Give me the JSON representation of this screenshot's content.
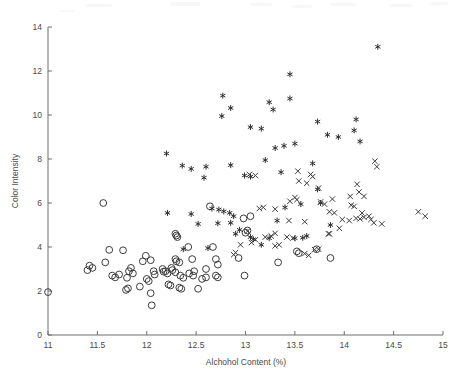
{
  "figure": {
    "background_color": "#ffffff",
    "marker_color": "#3d3d3d",
    "axis_color": "#6e6e6e"
  },
  "chart_data": {
    "type": "scatter",
    "title": "",
    "xlabel": "Alchohol Content (%)",
    "ylabel": "Color Intensity",
    "xlim": [
      11,
      15
    ],
    "ylim": [
      0,
      14
    ],
    "xticks": [
      11,
      11.5,
      12,
      12.5,
      13,
      13.5,
      14,
      14.5,
      15
    ],
    "xtick_labels": [
      "11",
      "11.5",
      "12",
      "12.5",
      "13",
      "13.5",
      "14",
      "14.5",
      "15"
    ],
    "yticks": [
      0,
      2,
      4,
      6,
      8,
      10,
      12,
      14
    ],
    "ytick_labels": [
      "0",
      "2",
      "4",
      "6",
      "8",
      "10",
      "12",
      "14"
    ],
    "grid": false,
    "legend": null,
    "series": [
      {
        "name": "class-asterisk",
        "marker": "asterisk",
        "points": [
          [
            14.34,
            13.1
          ],
          [
            13.45,
            11.85
          ],
          [
            12.77,
            10.88
          ],
          [
            13.24,
            10.58
          ],
          [
            13.45,
            10.75
          ],
          [
            12.85,
            10.32
          ],
          [
            13.28,
            10.25
          ],
          [
            12.76,
            9.95
          ],
          [
            13.73,
            9.7
          ],
          [
            14.12,
            9.8
          ],
          [
            14.1,
            9.3
          ],
          [
            13.05,
            9.45
          ],
          [
            13.16,
            9.38
          ],
          [
            13.83,
            9.1
          ],
          [
            13.94,
            9.0
          ],
          [
            14.16,
            8.8
          ],
          [
            13.5,
            8.7
          ],
          [
            13.39,
            8.6
          ],
          [
            13.3,
            8.5
          ],
          [
            13.2,
            7.95
          ],
          [
            12.2,
            8.25
          ],
          [
            12.36,
            7.7
          ],
          [
            12.45,
            7.55
          ],
          [
            12.6,
            7.65
          ],
          [
            12.85,
            7.72
          ],
          [
            13.05,
            7.2
          ],
          [
            12.99,
            7.25
          ],
          [
            13.68,
            7.8
          ],
          [
            13.36,
            7.4
          ],
          [
            12.58,
            7.15
          ],
          [
            13.73,
            6.62
          ],
          [
            13.76,
            6.0
          ],
          [
            13.56,
            5.95
          ],
          [
            13.4,
            5.8
          ],
          [
            12.21,
            5.55
          ],
          [
            12.45,
            5.5
          ],
          [
            12.66,
            5.75
          ],
          [
            12.73,
            5.7
          ],
          [
            12.78,
            5.62
          ],
          [
            12.84,
            5.55
          ],
          [
            12.88,
            5.4
          ],
          [
            12.52,
            5.05
          ],
          [
            12.72,
            5.08
          ],
          [
            12.85,
            5.1
          ],
          [
            13.86,
            5.0
          ],
          [
            13.32,
            5.2
          ],
          [
            12.94,
            4.78
          ],
          [
            12.9,
            4.6
          ],
          [
            13.16,
            4.1
          ],
          [
            13.5,
            4.4
          ],
          [
            13.58,
            4.42
          ],
          [
            13.62,
            4.5
          ],
          [
            12.37,
            3.9
          ],
          [
            12.62,
            3.95
          ],
          [
            13.08,
            4.35
          ],
          [
            13.24,
            4.4
          ],
          [
            13.05,
            4.45
          ]
        ]
      },
      {
        "name": "class-circle",
        "marker": "circle",
        "points": [
          [
            11.0,
            1.95
          ],
          [
            11.56,
            6.0
          ],
          [
            11.62,
            3.87
          ],
          [
            11.76,
            3.85
          ],
          [
            11.42,
            3.15
          ],
          [
            11.45,
            3.05
          ],
          [
            11.4,
            2.95
          ],
          [
            11.58,
            3.3
          ],
          [
            11.65,
            2.7
          ],
          [
            11.68,
            2.62
          ],
          [
            11.72,
            2.75
          ],
          [
            11.84,
            3.05
          ],
          [
            11.82,
            2.9
          ],
          [
            11.86,
            2.8
          ],
          [
            11.8,
            2.6
          ],
          [
            11.79,
            2.05
          ],
          [
            11.81,
            2.12
          ],
          [
            11.99,
            3.6
          ],
          [
            11.96,
            3.35
          ],
          [
            12.04,
            3.4
          ],
          [
            12.07,
            2.9
          ],
          [
            12.0,
            2.55
          ],
          [
            12.02,
            2.45
          ],
          [
            12.08,
            2.75
          ],
          [
            12.05,
            1.35
          ],
          [
            12.04,
            1.9
          ],
          [
            12.16,
            3.0
          ],
          [
            12.19,
            2.9
          ],
          [
            12.21,
            2.8
          ],
          [
            12.29,
            3.45
          ],
          [
            12.3,
            3.35
          ],
          [
            12.33,
            3.3
          ],
          [
            12.25,
            3.05
          ],
          [
            12.26,
            2.95
          ],
          [
            12.29,
            2.85
          ],
          [
            12.22,
            2.3
          ],
          [
            12.24,
            2.25
          ],
          [
            12.34,
            2.7
          ],
          [
            12.37,
            2.6
          ],
          [
            12.33,
            2.15
          ],
          [
            12.35,
            2.1
          ],
          [
            12.29,
            4.6
          ],
          [
            12.3,
            4.52
          ],
          [
            12.31,
            4.45
          ],
          [
            12.42,
            4.0
          ],
          [
            12.46,
            3.45
          ],
          [
            12.43,
            2.8
          ],
          [
            12.47,
            2.7
          ],
          [
            12.52,
            2.1
          ],
          [
            12.6,
            3.0
          ],
          [
            12.56,
            2.55
          ],
          [
            12.6,
            2.62
          ],
          [
            12.64,
            5.85
          ],
          [
            12.67,
            4.0
          ],
          [
            12.7,
            3.45
          ],
          [
            12.72,
            3.2
          ],
          [
            12.7,
            2.7
          ],
          [
            12.72,
            2.62
          ],
          [
            12.93,
            3.5
          ],
          [
            12.99,
            2.7
          ],
          [
            13.05,
            5.4
          ],
          [
            13.02,
            4.75
          ],
          [
            13.0,
            4.65
          ],
          [
            12.98,
            5.3
          ],
          [
            13.33,
            3.3
          ],
          [
            13.52,
            3.8
          ],
          [
            13.54,
            3.72
          ],
          [
            13.72,
            3.9
          ],
          [
            13.86,
            3.5
          ],
          [
            12.17,
            2.88
          ],
          [
            11.93,
            2.2
          ],
          [
            12.48,
            2.9
          ]
        ]
      },
      {
        "name": "class-cross",
        "marker": "cross",
        "points": [
          [
            13.1,
            7.25
          ],
          [
            13.04,
            7.3
          ],
          [
            13.53,
            7.45
          ],
          [
            13.66,
            7.3
          ],
          [
            13.68,
            7.2
          ],
          [
            13.54,
            7.0
          ],
          [
            13.62,
            6.9
          ],
          [
            13.74,
            6.68
          ],
          [
            14.13,
            6.85
          ],
          [
            14.31,
            7.9
          ],
          [
            14.33,
            7.65
          ],
          [
            13.5,
            6.25
          ],
          [
            13.52,
            6.15
          ],
          [
            13.88,
            6.18
          ],
          [
            14.06,
            6.3
          ],
          [
            14.15,
            6.5
          ],
          [
            14.2,
            6.3
          ],
          [
            13.76,
            6.05
          ],
          [
            13.8,
            5.95
          ],
          [
            13.45,
            6.08
          ],
          [
            13.18,
            5.8
          ],
          [
            13.3,
            5.72
          ],
          [
            13.85,
            5.6
          ],
          [
            13.9,
            5.55
          ],
          [
            14.07,
            5.9
          ],
          [
            14.1,
            5.85
          ],
          [
            14.18,
            5.55
          ],
          [
            14.25,
            5.4
          ],
          [
            14.27,
            5.25
          ],
          [
            14.3,
            5.1
          ],
          [
            14.75,
            5.6
          ],
          [
            14.82,
            5.4
          ],
          [
            13.44,
            5.2
          ],
          [
            13.6,
            5.15
          ],
          [
            13.98,
            5.25
          ],
          [
            14.05,
            5.2
          ],
          [
            14.12,
            5.3
          ],
          [
            14.16,
            5.28
          ],
          [
            13.95,
            4.85
          ],
          [
            13.85,
            4.6
          ],
          [
            13.3,
            4.05
          ],
          [
            13.34,
            4.1
          ],
          [
            13.2,
            4.45
          ],
          [
            13.26,
            4.5
          ],
          [
            13.1,
            4.33
          ],
          [
            13.06,
            4.2
          ],
          [
            12.95,
            4.1
          ],
          [
            12.9,
            3.75
          ],
          [
            12.88,
            3.65
          ],
          [
            13.6,
            3.7
          ],
          [
            13.64,
            3.62
          ],
          [
            13.7,
            3.88
          ],
          [
            13.74,
            3.9
          ],
          [
            14.38,
            5.05
          ],
          [
            14.2,
            5.35
          ],
          [
            13.42,
            4.45
          ],
          [
            13.48,
            4.4
          ],
          [
            13.84,
            4.6
          ],
          [
            13.3,
            4.62
          ],
          [
            13.02,
            4.72
          ],
          [
            13.14,
            5.75
          ]
        ]
      }
    ]
  },
  "axes": {
    "x_axis_name": "x-axis",
    "y_axis_name": "y-axis"
  }
}
